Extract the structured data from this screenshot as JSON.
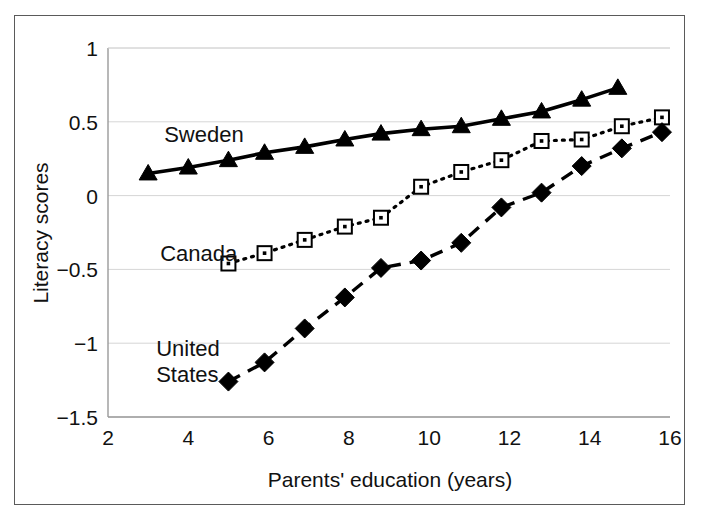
{
  "chart_data": {
    "type": "line",
    "title": "",
    "subtitle": "",
    "xlabel": "Parents' education (years)",
    "ylabel": "Literacy scores",
    "xlim": [
      2,
      16
    ],
    "ylim": [
      -1.5,
      1
    ],
    "xticks": [
      2,
      4,
      6,
      8,
      10,
      12,
      14,
      16
    ],
    "xtick_labels": [
      "2",
      "4",
      "6",
      "8",
      "10",
      "12",
      "14",
      "16"
    ],
    "yticks": [
      1,
      0.5,
      0,
      -0.5,
      -1,
      -1.5
    ],
    "ytick_labels": [
      "1",
      "0.5",
      "0",
      "-0.5",
      "-1",
      "-1.5"
    ],
    "grid": "horizontal",
    "legend_position": "inline-annotations",
    "series": [
      {
        "name": "Sweden",
        "label": "Sweden",
        "marker": "filled-triangle",
        "line_style": "solid",
        "color": "#000000",
        "label_x": 3.4,
        "label_y": 0.36,
        "points": [
          {
            "x": 3.0,
            "y": 0.15
          },
          {
            "x": 4.0,
            "y": 0.19
          },
          {
            "x": 5.0,
            "y": 0.24
          },
          {
            "x": 5.9,
            "y": 0.29
          },
          {
            "x": 6.9,
            "y": 0.33
          },
          {
            "x": 7.9,
            "y": 0.38
          },
          {
            "x": 8.8,
            "y": 0.42
          },
          {
            "x": 9.8,
            "y": 0.45
          },
          {
            "x": 10.8,
            "y": 0.47
          },
          {
            "x": 11.8,
            "y": 0.52
          },
          {
            "x": 12.8,
            "y": 0.57
          },
          {
            "x": 13.8,
            "y": 0.65
          },
          {
            "x": 14.7,
            "y": 0.73
          }
        ]
      },
      {
        "name": "Canada",
        "label": "Canada",
        "marker": "open-square",
        "line_style": "dotted",
        "color": "#000000",
        "label_x": 3.3,
        "label_y": -0.44,
        "points": [
          {
            "x": 5.0,
            "y": -0.46
          },
          {
            "x": 5.9,
            "y": -0.39
          },
          {
            "x": 6.9,
            "y": -0.3
          },
          {
            "x": 7.9,
            "y": -0.21
          },
          {
            "x": 8.8,
            "y": -0.15
          },
          {
            "x": 9.8,
            "y": 0.06
          },
          {
            "x": 10.8,
            "y": 0.16
          },
          {
            "x": 11.8,
            "y": 0.24
          },
          {
            "x": 12.8,
            "y": 0.37
          },
          {
            "x": 13.8,
            "y": 0.38
          },
          {
            "x": 14.8,
            "y": 0.47
          },
          {
            "x": 15.8,
            "y": 0.53
          }
        ]
      },
      {
        "name": "United States",
        "label": "United\nStates",
        "label_line1": "United",
        "label_line2": "States",
        "marker": "filled-diamond",
        "line_style": "dashed",
        "color": "#000000",
        "label_x": 3.2,
        "label_y": -1.09,
        "points": [
          {
            "x": 5.0,
            "y": -1.26
          },
          {
            "x": 5.9,
            "y": -1.13
          },
          {
            "x": 6.9,
            "y": -0.9
          },
          {
            "x": 7.9,
            "y": -0.69
          },
          {
            "x": 8.8,
            "y": -0.49
          },
          {
            "x": 9.8,
            "y": -0.44
          },
          {
            "x": 10.8,
            "y": -0.32
          },
          {
            "x": 11.8,
            "y": -0.08
          },
          {
            "x": 12.8,
            "y": 0.02
          },
          {
            "x": 13.8,
            "y": 0.2
          },
          {
            "x": 14.8,
            "y": 0.32
          },
          {
            "x": 15.8,
            "y": 0.43
          }
        ]
      }
    ]
  }
}
